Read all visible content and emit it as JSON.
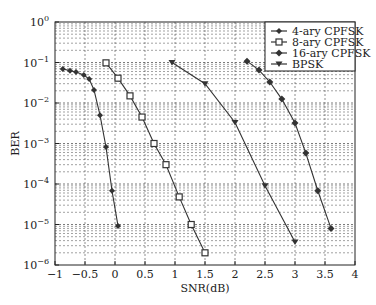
{
  "chart_data": {
    "type": "line",
    "title": "",
    "xlabel": "SNR(dB)",
    "ylabel": "BER",
    "xlim": [
      -1,
      4
    ],
    "ylim": [
      1e-06,
      1
    ],
    "yscale": "log",
    "grid": true,
    "legend_position": "upper right",
    "x_ticks": [
      "-1",
      "-0.5",
      "0",
      "0.5",
      "1",
      "1.5",
      "2",
      "2.5",
      "3",
      "3.5",
      "4"
    ],
    "y_ticks": [
      "10^0",
      "10^-1",
      "10^-2",
      "10^-3",
      "10^-4",
      "10^-5",
      "10^-6"
    ],
    "series": [
      {
        "name": "4-ary CPFSK",
        "marker": "dot",
        "x": [
          -0.87,
          -0.75,
          -0.65,
          -0.52,
          -0.43,
          -0.35,
          -0.25,
          -0.15,
          -0.05,
          0.05
        ],
        "y": [
          0.069,
          0.063,
          0.058,
          0.049,
          0.039,
          0.021,
          0.005,
          0.00082,
          6.8e-05,
          9.2e-06
        ]
      },
      {
        "name": "8-ary CPFSK",
        "marker": "square",
        "x": [
          -0.15,
          0.05,
          0.25,
          0.45,
          0.65,
          0.85,
          1.07,
          1.27,
          1.5
        ],
        "y": [
          0.098,
          0.041,
          0.015,
          0.0045,
          0.001,
          0.0003,
          4.8e-05,
          1e-05,
          2e-06
        ]
      },
      {
        "name": "16-ary CPFSK",
        "marker": "diamond",
        "x": [
          2.2,
          2.4,
          2.58,
          2.78,
          3.0,
          3.18,
          3.38,
          3.6
        ],
        "y": [
          0.108,
          0.065,
          0.033,
          0.0125,
          0.0032,
          0.00058,
          6.8e-05,
          8e-06
        ]
      },
      {
        "name": "BPSK",
        "marker": "triangle-down",
        "x": [
          0.95,
          1.5,
          2.0,
          2.5,
          3.0
        ],
        "y": [
          0.1,
          0.03,
          0.0033,
          9e-05,
          3.7e-06
        ]
      }
    ]
  }
}
